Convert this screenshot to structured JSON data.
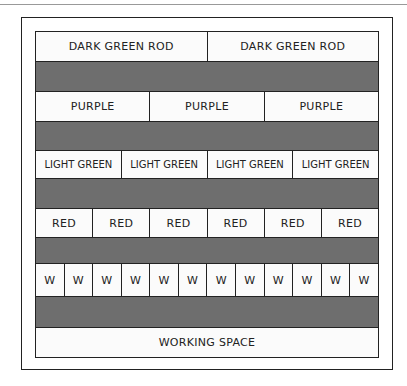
{
  "diagram": {
    "rows": [
      {
        "type": "rods",
        "labels": [
          "DARK GREEN ROD",
          "DARK GREEN ROD"
        ],
        "height": 30
      },
      {
        "type": "gap",
        "height": 30
      },
      {
        "type": "rods",
        "labels": [
          "PURPLE",
          "PURPLE",
          "PURPLE"
        ],
        "height": 30
      },
      {
        "type": "gap",
        "height": 29
      },
      {
        "type": "rods",
        "labels": [
          "LIGHT GREEN",
          "LIGHT GREEN",
          "LIGHT GREEN",
          "LIGHT GREEN"
        ],
        "height": 28
      },
      {
        "type": "gap",
        "height": 30
      },
      {
        "type": "rods",
        "labels": [
          "RED",
          "RED",
          "RED",
          "RED",
          "RED",
          "RED"
        ],
        "height": 29
      },
      {
        "type": "gap",
        "height": 26
      },
      {
        "type": "rods",
        "labels": [
          "W",
          "W",
          "W",
          "W",
          "W",
          "W",
          "W",
          "W",
          "W",
          "W",
          "W",
          "W"
        ],
        "height": 33
      },
      {
        "type": "gap",
        "height": 31
      },
      {
        "type": "rods",
        "labels": [
          "WORKING SPACE"
        ],
        "height": 29
      }
    ],
    "colors": {
      "gap": "#6e6e6e",
      "cell": "#fbfbfb",
      "line": "#222222"
    }
  }
}
